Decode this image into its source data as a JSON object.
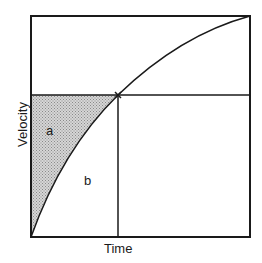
{
  "diagram": {
    "xlabel": "Time",
    "ylabel": "Velocity",
    "regions": [
      {
        "id": "a",
        "label": "a",
        "fill": "stippled gray"
      },
      {
        "id": "b",
        "label": "b",
        "fill": "none"
      }
    ],
    "colors": {
      "line": "#1a1a1a",
      "shade": "#bdbdbd",
      "background": "#ffffff"
    }
  }
}
